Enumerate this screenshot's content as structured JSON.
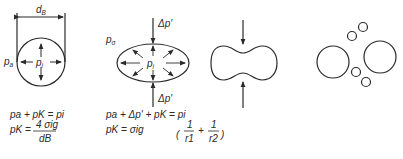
{
  "figure": {
    "panel1": {
      "diameter_label": "d",
      "diameter_sub": "B",
      "outer_pressure": "p",
      "outer_sub": "a",
      "inner_pressure": "p",
      "inner_sub": "i"
    },
    "panel2": {
      "top_force": "Δp'",
      "bottom_force": "Δp'",
      "outer_pressure": "p",
      "outer_sub": "σ",
      "inner_pressure": "p",
      "inner_sub": "i"
    },
    "panel3": {
      "description": "necking droplet under compression"
    },
    "panel4": {
      "description": "droplet breakup into fragments"
    }
  },
  "equations": {
    "eq1_line1": "pa + pK = pi",
    "eq1_line2_lhs": "pK =",
    "eq1_line2_num": "4 σig",
    "eq1_line2_den": "dB",
    "eq2_line1": "pa + Δp' + pK = pi",
    "eq2_line2_lhs": "pK = σig",
    "eq2_frac1_num": "1",
    "eq2_frac1_den": "r1",
    "eq2_plus": "+",
    "eq2_frac2_num": "1",
    "eq2_frac2_den": "r2"
  }
}
